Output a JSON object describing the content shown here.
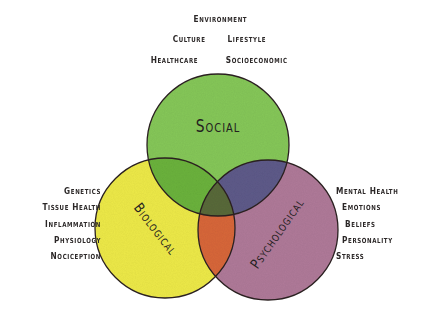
{
  "diagram": {
    "type": "venn",
    "circles": {
      "social": {
        "label": "Social",
        "color": "#86c85a"
      },
      "biological": {
        "label": "Biological",
        "color": "#eeea4a"
      },
      "psychological": {
        "label": "Psychological",
        "color": "#b07a9a"
      }
    },
    "overlaps": {
      "social_biological": "#6cb33e",
      "social_psychological": "#5e5c8a",
      "biological_psychological": "#d8683a",
      "center": "#5a6a3a"
    },
    "outline_color": "#2a2020"
  },
  "factors": {
    "social": {
      "rows": [
        [
          "Environment"
        ],
        [
          "Culture",
          "Lifestyle"
        ],
        [
          "Healthcare",
          "Socioeconomic"
        ]
      ]
    },
    "biological": {
      "items": [
        "Genetics",
        "Tissue Health",
        "Inflammation",
        "Physiology",
        "Nociception"
      ]
    },
    "psychological": {
      "items": [
        "Mental Health",
        "Emotions",
        "Beliefs",
        "Personality",
        "Stress"
      ]
    }
  }
}
